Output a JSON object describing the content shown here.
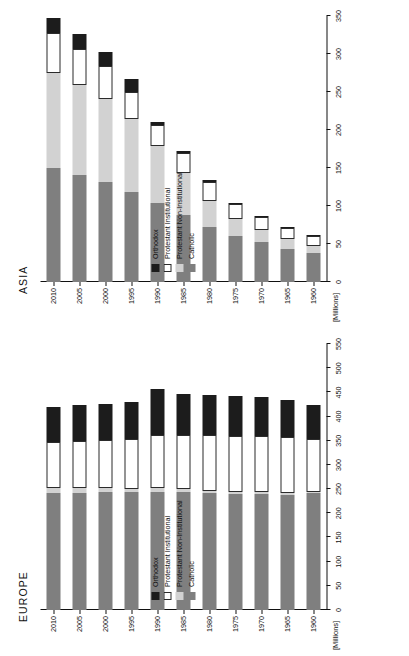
{
  "figure": {
    "units_label": "[Millions]",
    "legend_items": [
      {
        "key": "orthodox",
        "label": "Orthodox",
        "color": "#1c1c1c"
      },
      {
        "key": "prot-inst",
        "label": "Protestant Institutional",
        "color": "#ffffff"
      },
      {
        "key": "prot-non",
        "label": "Protestant Non-Institutional",
        "color": "#d2d2d2"
      },
      {
        "key": "catholic",
        "label": "Catholic",
        "color": "#7f7f7f"
      }
    ]
  },
  "chart_data": [
    {
      "type": "bar",
      "title": "EUROPE",
      "orientation": "horizontal-stacked",
      "xlabel": "",
      "ylabel": "[Millions]",
      "ylim": [
        0,
        550
      ],
      "yticks": [
        0,
        50,
        100,
        150,
        200,
        250,
        300,
        350,
        400,
        450,
        500,
        550
      ],
      "grid": false,
      "legend_position": "inside-left",
      "categories": [
        "1960",
        "1965",
        "1970",
        "1975",
        "1980",
        "1985",
        "1990",
        "1995",
        "2000",
        "2005",
        "2010"
      ],
      "series": [
        {
          "name": "Catholic",
          "color": "#7f7f7f",
          "values": [
            241,
            238,
            240,
            240,
            241,
            243,
            245,
            243,
            243,
            242,
            241
          ]
        },
        {
          "name": "Protestant Non-Institutional",
          "color": "#d2d2d2",
          "values": [
            2,
            4,
            5,
            5,
            6,
            7,
            8,
            8,
            9,
            10,
            11
          ]
        },
        {
          "name": "Protestant Institutional",
          "color": "#ffffff",
          "values": [
            110,
            115,
            115,
            115,
            114,
            112,
            108,
            103,
            100,
            98,
            96
          ]
        },
        {
          "name": "Orthodox",
          "color": "#1c1c1c",
          "values": [
            71,
            77,
            80,
            82,
            83,
            84,
            96,
            76,
            74,
            73,
            72
          ]
        }
      ],
      "totals": [
        424,
        434,
        440,
        442,
        444,
        446,
        449,
        430,
        426,
        423,
        420
      ]
    },
    {
      "type": "bar",
      "title": "ASIA",
      "orientation": "horizontal-stacked",
      "xlabel": "",
      "ylabel": "[Millions]",
      "ylim": [
        0,
        350
      ],
      "yticks": [
        0,
        50,
        100,
        150,
        200,
        250,
        300,
        350
      ],
      "grid": false,
      "legend_position": "inside-left",
      "categories": [
        "1960",
        "1965",
        "1970",
        "1975",
        "1980",
        "1985",
        "1990",
        "1995",
        "2000",
        "2005",
        "2010"
      ],
      "series": [
        {
          "name": "Catholic",
          "color": "#7f7f7f",
          "values": [
            38,
            44,
            52,
            61,
            72,
            88,
            104,
            119,
            131,
            141,
            150
          ]
        },
        {
          "name": "Protestant Non-Institutional",
          "color": "#d2d2d2",
          "values": [
            9,
            12,
            16,
            22,
            34,
            55,
            75,
            95,
            110,
            118,
            125
          ]
        },
        {
          "name": "Protestant Institutional",
          "color": "#ffffff",
          "values": [
            13,
            15,
            17,
            19,
            26,
            27,
            28,
            36,
            43,
            48,
            52
          ]
        },
        {
          "name": "Orthodox",
          "color": "#1c1c1c",
          "values": [
            1,
            1,
            2,
            2,
            2,
            3,
            3,
            17,
            19,
            20,
            21
          ]
        }
      ],
      "totals": [
        61,
        72,
        87,
        104,
        134,
        173,
        210,
        267,
        303,
        327,
        348
      ]
    }
  ]
}
